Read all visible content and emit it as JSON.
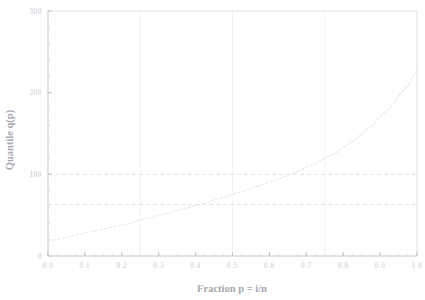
{
  "figure": {
    "background_color": "#ffffff",
    "title_remnant": "",
    "width": 425,
    "height": 300
  },
  "chart_data": {
    "type": "line",
    "title": "",
    "xlabel": "Fraction  p = i/n",
    "ylabel": "Quantile q(p)",
    "xlim": [
      0.0,
      1.0
    ],
    "ylim": [
      0,
      300
    ],
    "grid": true,
    "grid_orientation": "vertical-quartiles",
    "legend": "none",
    "line_style": "dashed",
    "line_color": "#e8e8ec",
    "axis_color": "#d8d8de",
    "tick_label_color": "#c9c9cf",
    "axis_title_color": "#a8a8b0",
    "reference_line_color": "#e0e0e6",
    "xticks": [
      0.0,
      0.1,
      0.2,
      0.3,
      0.4,
      0.5,
      0.6,
      0.7,
      0.8,
      0.9,
      1.0
    ],
    "xtick_labels": [
      "0.0",
      "0.1",
      "0.2",
      "0.3",
      "0.4",
      "0.5",
      "0.6",
      "0.7",
      "0.8",
      "0.9",
      "1.0"
    ],
    "yticks": [
      0,
      100,
      200,
      300
    ],
    "ytick_labels": [
      "0",
      "100",
      "200",
      "300"
    ],
    "ytick_minor_step": 20,
    "xtick_minor_step": 0.025,
    "vertical_gridlines": [
      0.25,
      0.5,
      0.75
    ],
    "horizontal_reference_lines": [
      {
        "value": 63,
        "label": ""
      },
      {
        "value": 100,
        "label": ""
      }
    ],
    "x": [
      0.0,
      0.02,
      0.05,
      0.08,
      0.1,
      0.13,
      0.15,
      0.18,
      0.2,
      0.23,
      0.25,
      0.28,
      0.3,
      0.33,
      0.35,
      0.38,
      0.4,
      0.43,
      0.45,
      0.48,
      0.5,
      0.53,
      0.55,
      0.58,
      0.6,
      0.63,
      0.65,
      0.68,
      0.7,
      0.73,
      0.75,
      0.78,
      0.8,
      0.83,
      0.85,
      0.88,
      0.9,
      0.93,
      0.95,
      0.98,
      1.0
    ],
    "y": [
      18,
      20,
      23,
      26,
      28,
      31,
      33,
      36,
      38,
      41,
      44,
      47,
      50,
      53,
      56,
      59,
      62,
      65,
      69,
      72,
      76,
      79,
      83,
      87,
      91,
      95,
      99,
      104,
      109,
      114,
      120,
      126,
      133,
      141,
      150,
      160,
      171,
      183,
      196,
      211,
      228
    ],
    "annotations": []
  }
}
